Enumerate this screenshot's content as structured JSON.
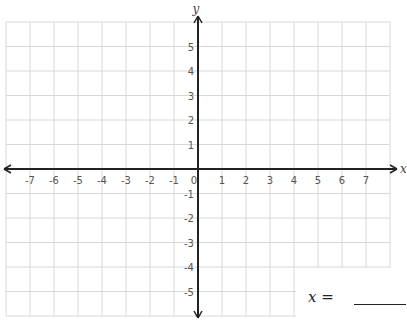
{
  "graph": {
    "x_axis_label": "x",
    "y_axis_label": "y",
    "x_range": [
      -8,
      8
    ],
    "y_range": [
      -6,
      6
    ],
    "x_tick_labels": [
      "-7",
      "-6",
      "-5",
      "-4",
      "-3",
      "-2",
      "-1",
      "0",
      "1",
      "2",
      "3",
      "4",
      "5",
      "6",
      "7"
    ],
    "x_tick_values": [
      -7,
      -6,
      -5,
      -4,
      -3,
      -2,
      -1,
      0,
      1,
      2,
      3,
      4,
      5,
      6,
      7
    ],
    "y_tick_labels": [
      "5",
      "4",
      "3",
      "2",
      "1",
      "-1",
      "-2",
      "-3",
      "-4",
      "-5"
    ],
    "y_tick_values": [
      5,
      4,
      3,
      2,
      1,
      -1,
      -2,
      -3,
      -4,
      -5
    ],
    "grid_color": "#d8d8d8",
    "axis_color": "#222222"
  },
  "answer": {
    "variable": "x",
    "equals": " = "
  }
}
